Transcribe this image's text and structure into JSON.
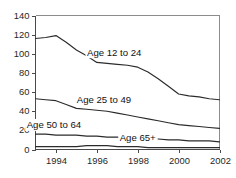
{
  "chart_data": {
    "type": "line",
    "title": "",
    "subtitle": "",
    "xlabel": "",
    "ylabel": "",
    "xlim": [
      1993,
      2002
    ],
    "ylim": [
      0,
      140
    ],
    "grid": false,
    "legend_position": "inline-labels",
    "x": [
      1993,
      1993.5,
      1994,
      1994.5,
      1995,
      1995.5,
      1996,
      1996.5,
      1997,
      1997.5,
      1998,
      1998.5,
      1999,
      1999.5,
      2000,
      2000.5,
      2001,
      2001.5,
      2002
    ],
    "xticks": [
      1994,
      1996,
      1998,
      2000,
      2002
    ],
    "xtick_labels": [
      "1994",
      "1996",
      "1998",
      "2000",
      "2002"
    ],
    "yticks": [
      0,
      20,
      40,
      60,
      80,
      100,
      120,
      140
    ],
    "ytick_labels": [
      "0",
      "20",
      "40",
      "60",
      "80",
      "100",
      "120",
      "140"
    ],
    "series": [
      {
        "name": "Age 12 to 24",
        "label": "Age 12 to 24",
        "values": [
          116,
          117,
          119,
          112,
          104,
          98,
          91,
          90,
          89,
          88,
          86,
          81,
          74,
          66,
          58,
          56,
          55,
          53,
          52
        ]
      },
      {
        "name": "Age 25 to 49",
        "label": "Age 25 to 49",
        "values": [
          53,
          52,
          51,
          47,
          43,
          42,
          41,
          40,
          38,
          36,
          34,
          32,
          30,
          28,
          26,
          25,
          24,
          23,
          22
        ]
      },
      {
        "name": "Age 50 to 64",
        "label": "Age 50 to 64",
        "values": [
          16,
          16,
          15,
          15,
          15,
          14,
          14,
          13,
          13,
          12,
          12,
          11,
          11,
          10,
          10,
          9,
          9,
          9,
          8
        ]
      },
      {
        "name": "Age 65+",
        "label": "Age 65+",
        "values": [
          3,
          3,
          3,
          3,
          3,
          4,
          4,
          4,
          3,
          3,
          3,
          2,
          2,
          2,
          2,
          2,
          2,
          2,
          2
        ]
      }
    ],
    "series_label_positions": [
      {
        "name": "Age 12 to 24",
        "x": 1996.85,
        "y": 98
      },
      {
        "name": "Age 25 to 49",
        "x": 1996.35,
        "y": 49
      },
      {
        "name": "Age 50 to 64",
        "x": 1993.9,
        "y": 22
      },
      {
        "name": "Age 65+",
        "x": 1998.0,
        "y": 9
      }
    ]
  },
  "axes": {
    "y_tick_labels": [
      "140",
      "120",
      "100",
      "80",
      "60",
      "40",
      "20",
      "0"
    ],
    "x_tick_labels": [
      "1994",
      "1996",
      "1998",
      "2000",
      "2002"
    ]
  },
  "series_labels": {
    "s0": "Age 12 to 24",
    "s1": "Age 25 to 49",
    "s2": "Age 50 to 64",
    "s3": "Age 65+"
  },
  "colors": {
    "line": "#2b2b2b",
    "axis": "#4a4a4a",
    "frame": "#8c8c8c",
    "text": "#1f1f1f",
    "background": "#ffffff"
  }
}
